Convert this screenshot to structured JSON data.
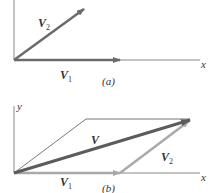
{
  "diagram": {
    "panel_a": {
      "caption": "(a)",
      "axis_x_label": "x",
      "vectors": [
        {
          "name": "V",
          "subscript": "1",
          "color": "#6e6e6e"
        },
        {
          "name": "V",
          "subscript": "2",
          "color": "#6e6e6e"
        }
      ]
    },
    "panel_b": {
      "caption": "(b)",
      "axis_x_label": "x",
      "axis_y_label": "y",
      "vectors": [
        {
          "name": "V",
          "subscript": "1",
          "color": "#a8a8a8"
        },
        {
          "name": "V",
          "subscript": "2",
          "color": "#a8a8a8"
        },
        {
          "name": "V",
          "subscript": "",
          "color": "#5a5a5a"
        }
      ]
    },
    "colors": {
      "axis": "#888888",
      "construction": "#777777",
      "dark_vector": "#6b6b6b",
      "light_vector": "#a9a9a9",
      "resultant": "#5c5c5c"
    }
  }
}
